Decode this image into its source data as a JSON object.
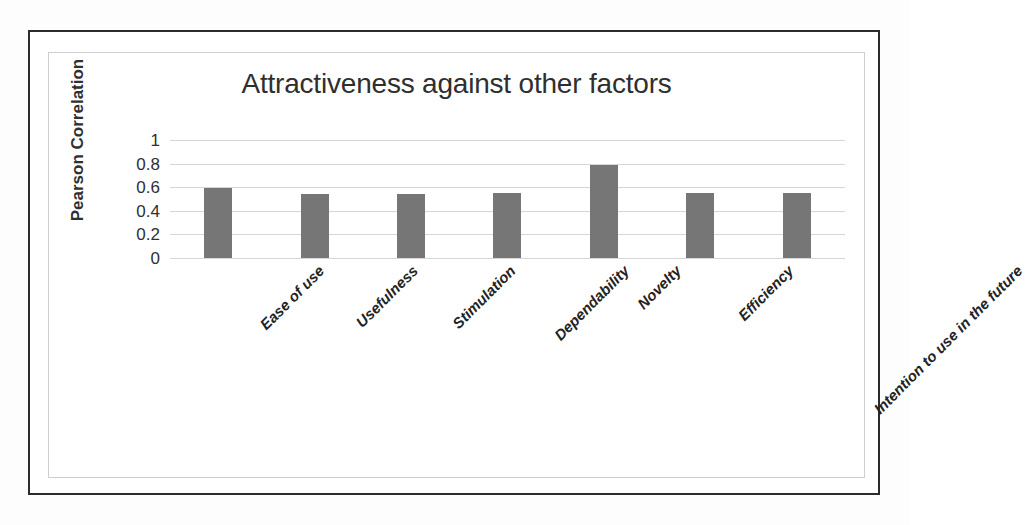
{
  "chart_data": {
    "type": "bar",
    "title": "Attractiveness against other factors",
    "xlabel": "",
    "ylabel": "Pearson Correlation",
    "categories": [
      "Ease of use",
      "Usefulness",
      "Stimulation",
      "Dependability",
      "Novelty",
      "Efficiency",
      "Intention to use in the future"
    ],
    "values": [
      0.59,
      0.54,
      0.54,
      0.55,
      0.79,
      0.55,
      0.55
    ],
    "ylim": [
      0,
      1
    ],
    "yticks": [
      "1",
      "0.8",
      "0.6",
      "0.4",
      "0.2",
      "0"
    ],
    "ytick_values": [
      1,
      0.8,
      0.6,
      0.4,
      0.2,
      0
    ],
    "grid": true,
    "legend": false,
    "series_color": "#767676",
    "gridline_color": "#d6d6d6"
  },
  "frame": {
    "outer_border_color": "#2b2b2b",
    "inner_border_color": "#cfcfcf",
    "background_color": "#ffffff"
  }
}
